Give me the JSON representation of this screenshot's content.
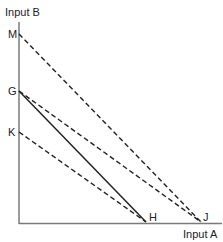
{
  "diagram": {
    "y_axis_label": "Input B",
    "x_axis_label": "Input A",
    "points": {
      "M": "M",
      "G": "G",
      "K": "K",
      "H": "H",
      "J": "J"
    },
    "lines": [
      {
        "from": "M",
        "to": "J",
        "style": "dashed"
      },
      {
        "from": "G",
        "to": "J",
        "style": "dashed"
      },
      {
        "from": "G",
        "to": "H",
        "style": "solid"
      },
      {
        "from": "K",
        "to": "H",
        "style": "dashed"
      }
    ],
    "colors": {
      "axis": "#777777",
      "line": "#222222"
    }
  }
}
